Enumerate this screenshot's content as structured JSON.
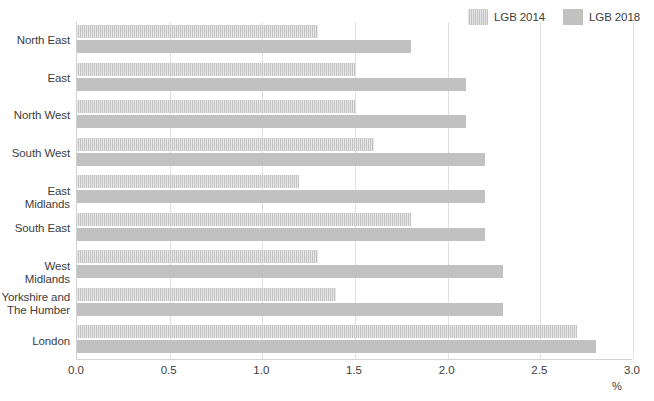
{
  "chart_data": {
    "type": "bar",
    "orientation": "horizontal",
    "title": "",
    "subtitle": "",
    "xlabel": "%",
    "ylabel": "",
    "xlim": [
      0.0,
      3.0
    ],
    "xticks": [
      "0.0",
      "0.5",
      "1.0",
      "1.5",
      "2.0",
      "2.5",
      "3.0"
    ],
    "xtick_values": [
      0.0,
      0.5,
      1.0,
      1.5,
      2.0,
      2.5,
      3.0
    ],
    "grid": true,
    "legend_position": "top-right",
    "categories": [
      "North East",
      "East",
      "North West",
      "South West",
      "East Midlands",
      "South East",
      "West Midlands",
      "Yorkshire and The Humber",
      "London"
    ],
    "category_lines": [
      [
        "North East"
      ],
      [
        "East"
      ],
      [
        "North West"
      ],
      [
        "South West"
      ],
      [
        "East Midlands"
      ],
      [
        "South East"
      ],
      [
        "West Midlands"
      ],
      [
        "Yorkshire and",
        "The Humber"
      ],
      [
        "London"
      ]
    ],
    "series": [
      {
        "name": "LGB 2014",
        "color": "#c3c3c3",
        "pattern": "vertical-hatch",
        "values": [
          1.3,
          1.5,
          1.5,
          1.6,
          1.2,
          1.8,
          1.3,
          1.4,
          2.7
        ]
      },
      {
        "name": "LGB 2018",
        "color": "#c1c1c1",
        "pattern": "solid",
        "values": [
          1.8,
          2.1,
          2.1,
          2.2,
          2.2,
          2.2,
          2.3,
          2.3,
          2.8
        ]
      }
    ]
  },
  "legend": {
    "entries": [
      {
        "label": "LGB 2014"
      },
      {
        "label": "LGB 2018"
      }
    ]
  },
  "axis": {
    "x_title": "%"
  }
}
